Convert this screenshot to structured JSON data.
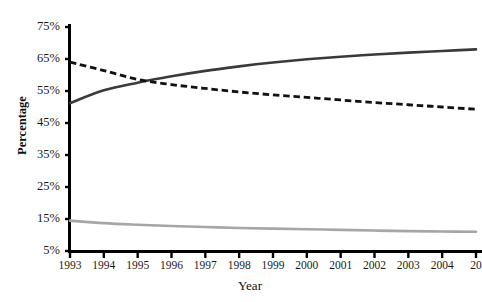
{
  "chart_data": {
    "type": "line",
    "title": "",
    "xlabel": "Year",
    "ylabel": "Percentage",
    "x": [
      1993,
      1994,
      1995,
      1996,
      1997,
      1998,
      1999,
      2000,
      2001,
      2002,
      2003,
      2004,
      2005
    ],
    "xtick_labels": [
      "1993",
      "1994",
      "1995",
      "1996",
      "1997",
      "1998",
      "1999",
      "2000",
      "2001",
      "2002",
      "2003",
      "2004",
      "20"
    ],
    "ytick_labels": [
      "75%",
      "65%",
      "55%",
      "45%",
      "35%",
      "25%",
      "15%",
      "5%"
    ],
    "ytick_values": [
      75,
      65,
      55,
      45,
      35,
      25,
      15,
      5
    ],
    "ylim": [
      5,
      75
    ],
    "xlim": [
      1993,
      2005
    ],
    "grid": false,
    "legend": "none",
    "series": [
      {
        "name": "declining-dashed-series",
        "style": "dashed",
        "color": "#111111",
        "values": [
          64.0,
          61.4,
          58.6,
          57.0,
          55.8,
          54.7,
          53.8,
          53.0,
          52.2,
          51.4,
          50.7,
          50.0,
          49.3
        ]
      },
      {
        "name": "rising-solid-series",
        "style": "solid",
        "color": "#3a3a3a",
        "values": [
          51.2,
          55.2,
          57.6,
          59.6,
          61.3,
          62.7,
          63.9,
          64.9,
          65.7,
          66.4,
          67.0,
          67.5,
          68.0
        ]
      },
      {
        "name": "low-gray-series",
        "style": "solid",
        "color": "#a6a6a6",
        "values": [
          14.5,
          13.7,
          13.2,
          12.8,
          12.5,
          12.2,
          12.0,
          11.8,
          11.6,
          11.4,
          11.2,
          11.1,
          11.0
        ]
      }
    ]
  },
  "axes": {
    "y_title": "Percentage",
    "x_title": "Year"
  }
}
